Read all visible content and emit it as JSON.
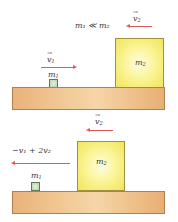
{
  "top_scene": {
    "condition_label": "m₁ ≪ m₂",
    "v2_label": "v",
    "v2_sub": "2",
    "v1_label": "v",
    "v1_sub": "1",
    "small_block_label": "m",
    "small_block_sub": "1",
    "big_block_label": "m",
    "big_block_sub": "2"
  },
  "bottom_scene": {
    "v2_label": "v",
    "v2_sub": "2",
    "result_velocity_label": "−v₁ + 2v₂",
    "small_block_label": "m",
    "small_block_sub": "1",
    "big_block_label": "m",
    "big_block_sub": "2"
  },
  "colors": {
    "arrow": "#e05a5a",
    "table": "#f3cd9b",
    "big_block": "#fbf59a",
    "small_block": "#b9d1ad"
  }
}
